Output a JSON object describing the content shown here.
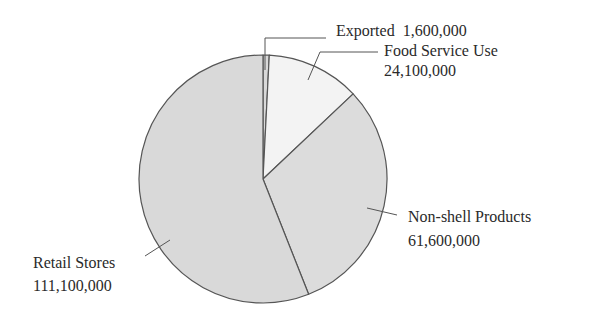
{
  "chart_data": {
    "type": "pie",
    "title": "",
    "start_angle_deg": 0,
    "direction": "clockwise",
    "slices": [
      {
        "label": "Exported",
        "value": 1600000,
        "value_label": "1,600,000",
        "color": "#d9d9d9"
      },
      {
        "label": "Food Service Use",
        "value": 24100000,
        "value_label": "24,100,000",
        "color": "#f3f3f3"
      },
      {
        "label": "Non-shell Products",
        "value": 61600000,
        "value_label": "61,600,000",
        "color": "#dcdcdc"
      },
      {
        "label": "Retail Stores",
        "value": 111100000,
        "value_label": "111,100,000",
        "color": "#d9d9d9"
      }
    ],
    "legend": "none (direct labels with leader lines)"
  },
  "labels": {
    "exported": {
      "name": "Exported",
      "value": "1,600,000"
    },
    "food": {
      "name": "Food Service Use",
      "value": "24,100,000"
    },
    "nonshell": {
      "name": "Non-shell Products",
      "value": "61,600,000"
    },
    "retail": {
      "name": "Retail Stores",
      "value": "111,100,000"
    }
  },
  "colors": {
    "outline": "#555555",
    "text": "#2a2a2a"
  }
}
